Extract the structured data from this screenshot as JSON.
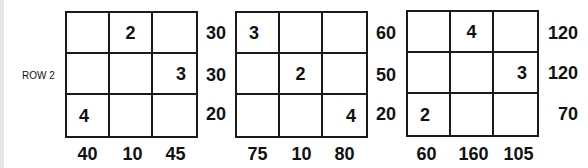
{
  "row_label": "ROW 2",
  "puzzles": [
    {
      "cells": [
        [
          "",
          "2",
          ""
        ],
        [
          "",
          "",
          "3"
        ],
        [
          "4",
          "",
          ""
        ]
      ],
      "row_sums": [
        "30",
        "30",
        "20"
      ],
      "col_sums": [
        "40",
        "10",
        "45"
      ]
    },
    {
      "cells": [
        [
          "3",
          "",
          ""
        ],
        [
          "",
          "2",
          ""
        ],
        [
          "",
          "",
          "4"
        ]
      ],
      "row_sums": [
        "60",
        "50",
        "20"
      ],
      "col_sums": [
        "75",
        "10",
        "80"
      ]
    },
    {
      "cells": [
        [
          "",
          "4",
          ""
        ],
        [
          "",
          "",
          "3"
        ],
        [
          "2",
          "",
          ""
        ]
      ],
      "row_sums": [
        "120",
        "120",
        "70"
      ],
      "col_sums": [
        "60",
        "160",
        "105"
      ]
    }
  ]
}
